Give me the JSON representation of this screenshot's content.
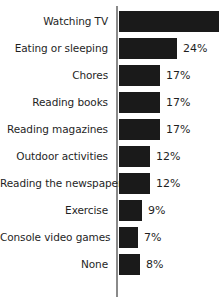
{
  "chart_data": {
    "type": "bar",
    "orientation": "horizontal",
    "title": "",
    "xlabel": "",
    "ylabel": "",
    "grid": false,
    "legend": false,
    "value_suffix": "%",
    "xlim": [
      0,
      40
    ],
    "note_clipped_bar": "Watching TV bar runs past the right edge of the image and its value label is not visible",
    "categories": [
      "Watching TV",
      "Eating or sleeping",
      "Chores",
      "Reading books",
      "Reading magazines",
      "Outdoor activities",
      "Reading the newspaper",
      "Exercise",
      "Console video games",
      "None"
    ],
    "values": [
      null,
      24,
      17,
      17,
      17,
      12,
      12,
      9,
      7,
      8
    ],
    "value_labels": [
      "",
      "24%",
      "17%",
      "17%",
      "17%",
      "12%",
      "12%",
      "9%",
      "7%",
      "8%"
    ],
    "bar_pixel_widths": [
      100,
      58,
      41,
      41,
      41,
      31,
      31,
      23,
      19,
      21
    ]
  },
  "colors": {
    "bar": "#1a1a1a",
    "axis": "#8a8a8a",
    "text": "#1f1f1f",
    "background": "#ffffff"
  }
}
